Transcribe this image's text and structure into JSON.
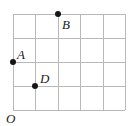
{
  "figure": {
    "background_color": "#ffffff",
    "grid": {
      "line_color": "#b9b9b9",
      "columns": 5,
      "rows": 4,
      "left": 13,
      "top": 14,
      "right": 125,
      "bottom": 110,
      "cell_width": 22.4,
      "cell_height": 24,
      "vertical_line_x": [
        13,
        35,
        58,
        80,
        103,
        125
      ],
      "horizontal_line_y": [
        14,
        38,
        62,
        86,
        110
      ]
    },
    "origin": {
      "label": "O",
      "x": 6,
      "y": 112
    },
    "points": [
      {
        "id": "point-b",
        "label": "B",
        "x": 58,
        "y": 14,
        "grid_col": 2,
        "grid_row": 4,
        "label_x": 62,
        "label_y": 18,
        "color": "#161616"
      },
      {
        "id": "point-a",
        "label": "A",
        "x": 13,
        "y": 62,
        "grid_col": 0,
        "grid_row": 2,
        "label_x": 17,
        "label_y": 48,
        "color": "#161616"
      },
      {
        "id": "point-d",
        "label": "D",
        "x": 35,
        "y": 86,
        "grid_col": 1,
        "grid_row": 1,
        "label_x": 40,
        "label_y": 72,
        "color": "#161616"
      }
    ]
  },
  "chart_data": {
    "type": "scatter",
    "title": "",
    "xlabel": "",
    "ylabel": "",
    "xlim": [
      0,
      5
    ],
    "ylim": [
      0,
      4
    ],
    "grid": true,
    "legend": "none",
    "categories": [
      "A",
      "B",
      "D"
    ],
    "series": [
      {
        "name": "labeled-points",
        "points": [
          {
            "label": "A",
            "x": 0,
            "y": 2
          },
          {
            "label": "B",
            "x": 2,
            "y": 4
          },
          {
            "label": "D",
            "x": 1,
            "y": 1
          }
        ]
      }
    ],
    "annotations": [
      {
        "text": "O",
        "x": 0,
        "y": 0,
        "role": "origin"
      },
      {
        "text": "A",
        "x": 0,
        "y": 2,
        "role": "point-label"
      },
      {
        "text": "B",
        "x": 2,
        "y": 4,
        "role": "point-label"
      },
      {
        "text": "D",
        "x": 1,
        "y": 1,
        "role": "point-label"
      }
    ]
  }
}
